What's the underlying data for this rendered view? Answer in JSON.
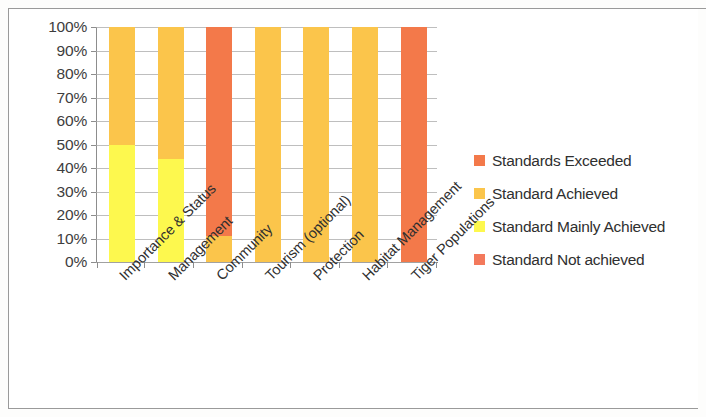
{
  "chart_data": {
    "type": "bar",
    "subtype": "100% stacked column",
    "title": "",
    "subtitle": "",
    "xlabel": "",
    "ylabel": "",
    "ylim": [
      0,
      100
    ],
    "y_tick_labels": [
      "0%",
      "10%",
      "20%",
      "30%",
      "40%",
      "50%",
      "60%",
      "70%",
      "80%",
      "90%",
      "100%"
    ],
    "y_tick_values": [
      0,
      10,
      20,
      30,
      40,
      50,
      60,
      70,
      80,
      90,
      100
    ],
    "grid": true,
    "legend_position": "right",
    "categories": [
      "Importance & Status",
      "Management",
      "Community",
      "Tourism (optional)",
      "Protection",
      "Habitat Management",
      "Tiger Populations"
    ],
    "series": [
      {
        "name": "Standards Exceeded",
        "color": "#F3794A",
        "values": [
          0,
          0,
          89,
          0,
          0,
          0,
          100
        ]
      },
      {
        "name": "Standard Achieved",
        "color": "#FBC54B",
        "values": [
          50,
          56,
          11,
          100,
          100,
          100,
          0
        ]
      },
      {
        "name": "Standard Mainly Achieved",
        "color": "#FDF84E",
        "values": [
          50,
          44,
          0,
          0,
          0,
          0,
          0
        ]
      },
      {
        "name": "Standard Not achieved",
        "color": "#F3795C",
        "values": [
          0,
          0,
          0,
          0,
          0,
          0,
          0
        ]
      }
    ]
  },
  "legend": {
    "items": [
      {
        "label": "Standards Exceeded",
        "color": "#F3794A"
      },
      {
        "label": "Standard Achieved",
        "color": "#FBC54B"
      },
      {
        "label": "Standard Mainly Achieved",
        "color": "#FDF84E"
      },
      {
        "label": "Standard Not achieved",
        "color": "#F3795C"
      }
    ]
  }
}
